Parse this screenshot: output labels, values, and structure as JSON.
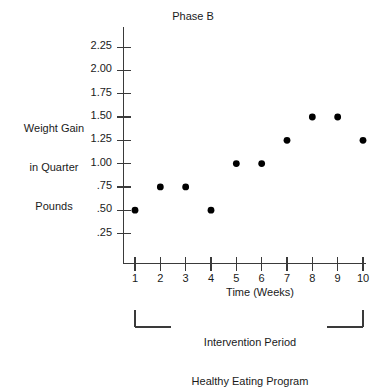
{
  "chart_data": {
    "type": "scatter",
    "title": "Phase B",
    "xlabel": "Time (Weeks)",
    "ylabel": "Weight Gain in Quarter Pounds",
    "ylabel_lines": [
      "Weight Gain",
      "in Quarter",
      "Pounds"
    ],
    "x": [
      1,
      2,
      3,
      4,
      5,
      6,
      7,
      8,
      9,
      10
    ],
    "values": [
      0.5,
      0.75,
      0.75,
      0.5,
      1.0,
      1.0,
      1.25,
      1.5,
      1.5,
      1.25
    ],
    "point_labels": [
      ".50",
      ".75",
      ".75",
      ".50",
      "1.00",
      "1.00",
      "1.25",
      "1.50",
      "1.50",
      "1.25"
    ],
    "x_tick_labels": [
      "1",
      "2",
      "3",
      "4",
      "5",
      "6",
      "7",
      "8",
      "9",
      "10"
    ],
    "y_ticks": [
      0.25,
      0.5,
      0.75,
      1.0,
      1.25,
      1.5,
      1.75,
      2.0,
      2.25
    ],
    "y_tick_labels": [
      ".25",
      ".50",
      ".75",
      "1.00",
      "1.25",
      "1.50",
      "1.75",
      "2.00",
      "2.25"
    ],
    "xlim": [
      0.45,
      10.6
    ],
    "ylim": [
      0.0,
      2.42
    ],
    "grid": false,
    "legend": null,
    "marker_color": "#000000",
    "axis_color": "#3a3a3a",
    "background_color": "#ffffff",
    "annotations": [
      {
        "name": "intervention-bracket",
        "lines": [
          "Intervention Period",
          "Healthy Eating Program"
        ],
        "span_start_week": 1,
        "span_end_week": 10
      }
    ]
  }
}
